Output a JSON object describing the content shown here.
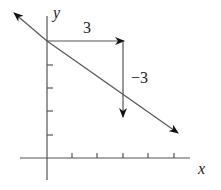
{
  "diagram": {
    "axes": {
      "x_label": "x",
      "y_label": "y"
    },
    "annotations": {
      "run_label": "3",
      "rise_label": "−3"
    },
    "colors": {
      "axis": "#555555",
      "line": "#555555",
      "arrowhead": "#111111",
      "text": "#222222"
    }
  }
}
